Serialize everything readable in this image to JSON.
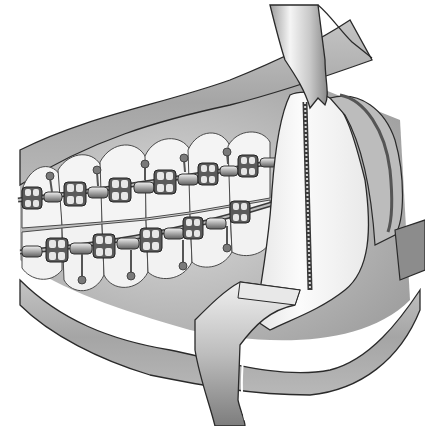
{
  "image": {
    "kind": "medical-illustration",
    "subject": "Surgical exposure of the mandibular ramus with orthodontic braces on upper and lower dental arches, held open by metal retractors",
    "style": "grayscale shaded line drawing",
    "width": 425,
    "height": 426
  },
  "colors": {
    "background": "#ffffff",
    "outline": "#2a2a2a",
    "lip_tissue": "#a9a9a9",
    "gum_tissue": "#bdbdbd",
    "tooth": "#f4f4f4",
    "bone": "#f7f7f7",
    "retractor_metal": "#d8d8d8",
    "bracket": "#555555",
    "archwire": "#8c8c8c",
    "cortical_cut": "#9a9a9a"
  },
  "elements": {
    "upper_lip_label": "upper-lip",
    "lower_lip_label": "lower-lip",
    "upper_teeth_count": 6,
    "lower_teeth_count": 6,
    "upper_brackets_count": 6,
    "lower_brackets_count": 6,
    "retractors": [
      "top-retractor",
      "bottom-retractor",
      "side-retractor"
    ]
  }
}
